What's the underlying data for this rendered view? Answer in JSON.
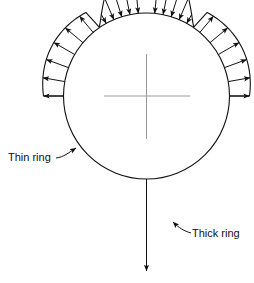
{
  "figure": {
    "background_color": "#ffffff",
    "line_color": "#111111",
    "centerline_color": "#9a9a9a",
    "width": 254,
    "height": 283
  },
  "labels": {
    "thin_ring": "Thin ring",
    "thick_ring": "Thick ring"
  },
  "chart_data": {
    "type": "diagram",
    "circle": {
      "cx": 146.5,
      "cy": 96,
      "r": 83
    },
    "centerline": {
      "cx": 146.5,
      "cy": 96,
      "horizontal_from_x": 104,
      "horizontal_to_x": 190,
      "vertical_from_y": 54,
      "vertical_to_y": 139,
      "color": "#9a9a9a"
    },
    "outward_arrow_angles_deg": [
      180,
      190,
      200,
      210,
      220,
      230,
      160,
      150,
      140,
      130,
      120
    ],
    "inward_arrow_angles_deg": [
      238,
      248,
      258,
      268,
      278,
      288,
      298,
      112,
      122,
      132,
      142
    ],
    "annotations": [
      {
        "text": "Thin ring",
        "x": 8,
        "y": 161,
        "leader_to_x": 76,
        "leader_to_y": 148
      },
      {
        "text": "Thick ring",
        "x": 192,
        "y": 237,
        "leader_to_x": 173,
        "leader_to_y": 222
      }
    ]
  }
}
